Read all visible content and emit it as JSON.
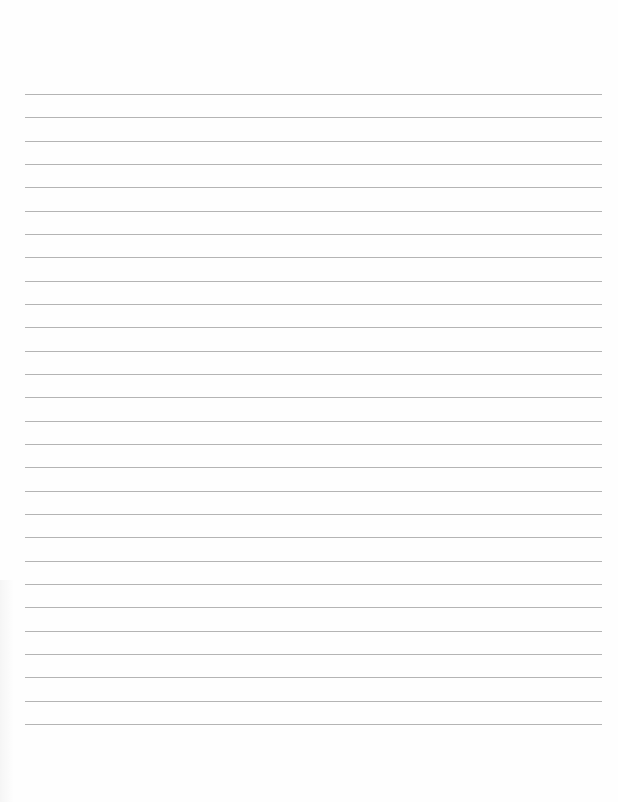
{
  "page": {
    "type": "blank lined paper",
    "background_color": "#ffffff",
    "line_color": "#b4b4b4",
    "line_count": 28,
    "first_line_y": 94,
    "line_spacing": 23.33,
    "line_left": 25,
    "line_right": 602
  }
}
